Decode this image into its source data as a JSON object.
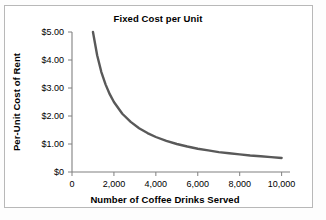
{
  "chart_data": {
    "type": "line",
    "title": "Fixed Cost per Unit",
    "xlabel": "Number of Coffee Drinks Served",
    "ylabel": "Per-Unit Cost of Rent",
    "xlim": [
      0,
      10400
    ],
    "ylim": [
      0,
      5.0
    ],
    "grid": false,
    "legend": "none",
    "xticks": [
      0,
      2000,
      4000,
      6000,
      8000,
      10000
    ],
    "xticklabels": [
      "0",
      "2,000",
      "4,000",
      "6,000",
      "8,000",
      "10,000"
    ],
    "yticks": [
      0,
      1,
      2,
      3,
      4,
      5
    ],
    "yticklabels": [
      "$0",
      "$1.00",
      "$2.00",
      "$3.00",
      "$4.00",
      "$5.00"
    ],
    "series": [
      {
        "name": "Per-unit fixed cost of rent",
        "color": "#595959",
        "x": [
          1000,
          1200,
          1400,
          1600,
          1800,
          2000,
          2400,
          2800,
          3200,
          3600,
          4000,
          4500,
          5000,
          5500,
          6000,
          6500,
          7000,
          7500,
          8000,
          8500,
          9000,
          9500,
          10000
        ],
        "values": [
          5.0,
          4.17,
          3.57,
          3.13,
          2.78,
          2.5,
          2.08,
          1.79,
          1.56,
          1.39,
          1.25,
          1.11,
          1.0,
          0.91,
          0.83,
          0.77,
          0.71,
          0.67,
          0.63,
          0.59,
          0.56,
          0.53,
          0.5
        ]
      }
    ]
  },
  "axis_colors": {
    "axis_line": "#808080",
    "curve": "#595959",
    "frame": "#b8b8b8",
    "text": "#1a1a1a"
  }
}
